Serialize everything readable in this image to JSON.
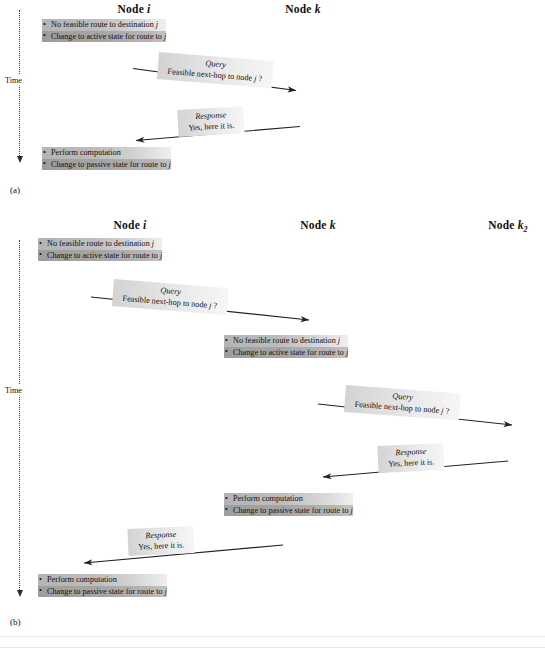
{
  "figure": {
    "panels": [
      {
        "id": "a",
        "caption": "(a)",
        "time_label": "Time",
        "headers": [
          {
            "name": "node-i",
            "prefix": "Node ",
            "var": "i",
            "sub": ""
          },
          {
            "name": "node-k",
            "prefix": "Node ",
            "var": "k",
            "sub": ""
          }
        ],
        "events": [
          {
            "name": "event-node-i-active",
            "line1": "No feasible route to destination ",
            "line1_var": "j",
            "line2": "Change to active state for route to ",
            "line2_var": "j"
          },
          {
            "name": "event-node-i-passive",
            "line1": "Perform computation",
            "line1_var": "",
            "line2": "Change to passive state for route to ",
            "line2_var": "j"
          }
        ],
        "messages": [
          {
            "name": "message-query-i-to-k",
            "title": "Query",
            "body": "Feasible next-hop to node ",
            "body_var": "j",
            "body_suffix": " ?"
          },
          {
            "name": "message-response-k-to-i",
            "title": "Response",
            "body": "Yes, here it is.",
            "body_var": "",
            "body_suffix": ""
          }
        ]
      },
      {
        "id": "b",
        "caption": "(b)",
        "time_label": "Time",
        "headers": [
          {
            "name": "node-i",
            "prefix": "Node ",
            "var": "i",
            "sub": ""
          },
          {
            "name": "node-k",
            "prefix": "Node ",
            "var": "k",
            "sub": ""
          },
          {
            "name": "node-k2",
            "prefix": "Node ",
            "var": "k",
            "sub": "2"
          }
        ],
        "events": [
          {
            "name": "event-node-i-active",
            "line1": "No feasible route to destination ",
            "line1_var": "j",
            "line2": "Change to active state for route to ",
            "line2_var": "j"
          },
          {
            "name": "event-node-k-active",
            "line1": "No feasible route to destination ",
            "line1_var": "j",
            "line2": "Change to active state for route to ",
            "line2_var": "j"
          },
          {
            "name": "event-node-k-passive",
            "line1": "Perform computation",
            "line1_var": "",
            "line2": "Change to passive state for route to ",
            "line2_var": "j"
          },
          {
            "name": "event-node-i-passive",
            "line1": "Perform computation",
            "line1_var": "",
            "line2": "Change to passive state for route to ",
            "line2_var": "j"
          }
        ],
        "messages": [
          {
            "name": "message-query-i-to-k",
            "title": "Query",
            "body": "Feasible next-hop to node ",
            "body_var": "j",
            "body_suffix": " ?"
          },
          {
            "name": "message-query-k-to-k2",
            "title": "Query",
            "body": "Feasible next-hop to node ",
            "body_var": "j",
            "body_suffix": " ?"
          },
          {
            "name": "message-response-k2-to-k",
            "title": "Response",
            "body": "Yes, here it is.",
            "body_var": "",
            "body_suffix": ""
          },
          {
            "name": "message-response-k-to-i",
            "title": "Response",
            "body": "Yes, here it is.",
            "body_var": "",
            "body_suffix": ""
          }
        ]
      }
    ]
  }
}
